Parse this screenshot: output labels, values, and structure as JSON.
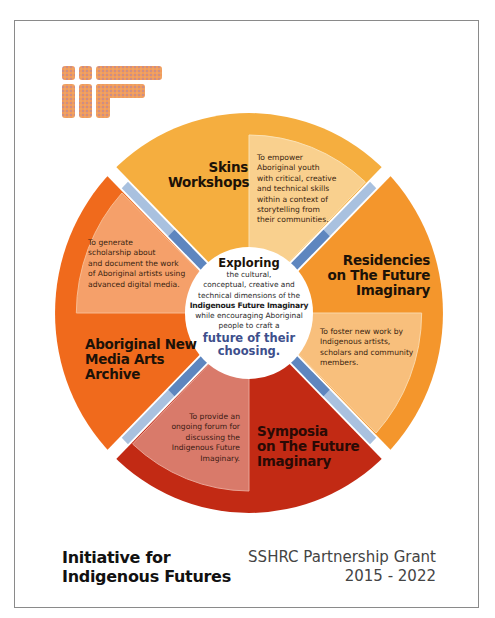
{
  "logo": {
    "text": "iiF",
    "color": "#f0955a"
  },
  "center": {
    "title": "Exploring",
    "body": "the cultural,\nconceptual, creative and\ntechnical dimensions of the",
    "bold": "Indigenous Future Imaginary",
    "body2": "while encouraging Aboriginal\npeople to craft a",
    "accent": "future of their\nchoosing."
  },
  "quadrants": [
    {
      "id": "top",
      "title": "Skins\nWorkshops",
      "description": "To empower\nAboriginal youth\nwith critical, creative\nand technical skills\nwithin a context of\nstorytelling from\ntheir communities.",
      "color": "#f5ae3f",
      "panel_color": "#f9d08e"
    },
    {
      "id": "right",
      "title": "Residencies\non The Future\nImaginary",
      "description": "To foster new work by\nIndigenous artists,\nscholars and community\nmembers.",
      "color": "#f4962c",
      "panel_color": "#f8bf7c"
    },
    {
      "id": "bottom",
      "title": "Symposia\non The Future\nImaginary",
      "description": "To provide an\nongoing forum for\ndiscussing the\nIndigenous Future\nImaginary.",
      "color": "#c22a14",
      "panel_color": "#d97a6a"
    },
    {
      "id": "left",
      "title": "Aboriginal New\nMedia Arts\nArchive",
      "description": "To generate\nscholarship about\nand document the work\nof Aboriginal artists using\nadvanced digital media.",
      "color": "#f06a1c",
      "panel_color": "#f5a06a"
    }
  ],
  "separator_colors": {
    "outer": "#a9c1df",
    "inner": "#5e86bf"
  },
  "footer": {
    "title": "Initiative for\nIndigenous Futures",
    "grant": "SSHRC Partnership Grant\n2015 - 2022"
  }
}
